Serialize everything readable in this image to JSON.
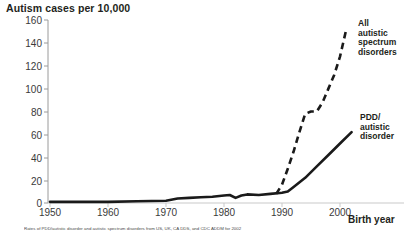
{
  "chart_data": {
    "type": "line",
    "title": "Autism cases per 10,000",
    "ylabel": "Autism cases per 10,000",
    "xlabel": "Birth year",
    "xlim": [
      1950,
      2003
    ],
    "ylim": [
      0,
      160
    ],
    "yticks": [
      0,
      20,
      40,
      60,
      80,
      100,
      120,
      140,
      160
    ],
    "xticks": [
      1950,
      1960,
      1970,
      1980,
      1990,
      2000
    ],
    "grid": false,
    "legend_position": "inline-right",
    "series": [
      {
        "name": "All autistic spectrum disorders",
        "style": "dashed",
        "color": "#1a1a1a",
        "x": [
          1989,
          1990,
          1991,
          1992,
          1993,
          1994,
          1995,
          1996,
          1997,
          1998,
          1999,
          2000,
          2001
        ],
        "values": [
          8,
          16,
          30,
          45,
          62,
          78,
          80,
          80,
          88,
          100,
          112,
          128,
          150
        ]
      },
      {
        "name": "PDD/ autistic disorder",
        "style": "solid",
        "color": "#1a1a1a",
        "x": [
          1950,
          1955,
          1960,
          1965,
          1970,
          1972,
          1974,
          1976,
          1978,
          1980,
          1981,
          1982,
          1983,
          1984,
          1986,
          1988,
          1990,
          1991,
          1992,
          1994,
          1996,
          1998,
          2000,
          2002
        ],
        "values": [
          1,
          1,
          1,
          1.5,
          2,
          4,
          4.5,
          5,
          5.5,
          6.5,
          7,
          4.5,
          6.5,
          7.5,
          7,
          8,
          9,
          10,
          14,
          22,
          32,
          42,
          52,
          62
        ]
      }
    ],
    "annotations": [
      {
        "id": "label-all",
        "text": "All\nautistic\nspectrum\ndisorders"
      },
      {
        "id": "label-pdd",
        "text": "PDD/\nautistic\ndisorder"
      }
    ]
  },
  "axis": {
    "y_title": "Autism cases per 10,000",
    "x_title": "Birth year",
    "y_tick_labels": [
      "160",
      "140",
      "120",
      "100",
      "80",
      "60",
      "40",
      "20",
      "0"
    ],
    "x_tick_labels": [
      "1950",
      "1960",
      "1970",
      "1980",
      "1990",
      "2000"
    ]
  },
  "labels": {
    "all_line1": "All",
    "all_line2": "autistic",
    "all_line3": "spectrum",
    "all_line4": "disorders",
    "pdd_line1": "PDD/",
    "pdd_line2": "autistic",
    "pdd_line3": "disorder"
  },
  "footnote": {
    "text": "Rates of PDD/autistic disorder and autistic spectrum disorders from US, UK, CA DDS, and CDC ADDM for 2002"
  },
  "colors": {
    "ink": "#231f20",
    "line": "#1a1a1a",
    "axis": "#9a9a9a"
  }
}
